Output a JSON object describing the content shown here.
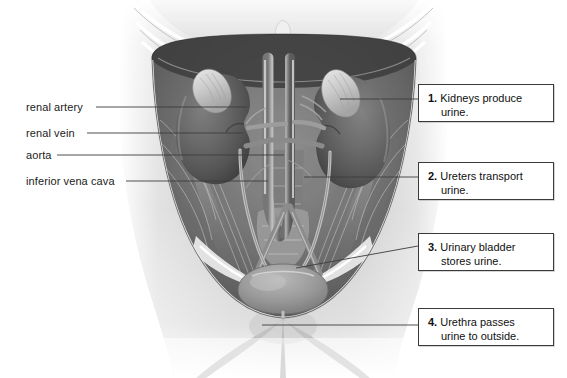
{
  "figure": {
    "type": "anatomical-illustration",
    "style": "grayscale medical illustration",
    "structures": [
      "ribcage",
      "diaphragm",
      "right kidney",
      "left kidney",
      "right adrenal gland",
      "left adrenal gland",
      "abdominal aorta",
      "inferior vena cava",
      "right ureter",
      "left ureter",
      "urinary bladder",
      "urethra",
      "psoas muscles",
      "pelvic bones"
    ]
  },
  "labels": {
    "renal_artery": "renal artery",
    "renal_vein": "renal vein",
    "aorta": "aorta",
    "inferior_vena_cava": "inferior vena cava"
  },
  "callouts": [
    {
      "number": "1.",
      "line1": "Kidneys produce",
      "line2": "urine."
    },
    {
      "number": "2.",
      "line1": "Ureters transport",
      "line2": "urine."
    },
    {
      "number": "3.",
      "line1": "Urinary bladder",
      "line2": "stores urine."
    },
    {
      "number": "4.",
      "line1": "Urethra passes",
      "line2": "urine to outside."
    }
  ],
  "colors": {
    "background": "#ffffff",
    "text": "#101010",
    "leader_line": "#3c3c3c",
    "box_border": "#3a3a3a",
    "illustration_dark": "#4a4a4a",
    "illustration_mid": "#8f8f8f",
    "illustration_light": "#d8d8d8"
  }
}
